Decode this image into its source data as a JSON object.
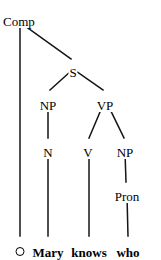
{
  "diagram": {
    "type": "syntax-tree",
    "sentence": "Mary knows who",
    "stroke_color": "#141414",
    "background_color": "#ffffff",
    "nodes": [
      {
        "id": "comp",
        "label": "Comp",
        "x": 20,
        "y": 15,
        "anchor": "left",
        "label_x": 2
      },
      {
        "id": "s",
        "label": "S",
        "x": 73,
        "y": 66
      },
      {
        "id": "np1",
        "label": "NP",
        "x": 48,
        "y": 99
      },
      {
        "id": "vp",
        "label": "VP",
        "x": 105,
        "y": 99
      },
      {
        "id": "n",
        "label": "N",
        "x": 48,
        "y": 146
      },
      {
        "id": "v",
        "label": "V",
        "x": 88,
        "y": 146
      },
      {
        "id": "np2",
        "label": "NP",
        "x": 125,
        "y": 146
      },
      {
        "id": "pron",
        "label": "Pron",
        "x": 127,
        "y": 190
      }
    ],
    "terminals": [
      {
        "id": "empty",
        "label": "O",
        "icon": "empty-circle-node",
        "x": 20,
        "y": 246
      },
      {
        "id": "mary",
        "label": "Mary",
        "x": 48,
        "y": 246
      },
      {
        "id": "knows",
        "label": "knows",
        "x": 89,
        "y": 246
      },
      {
        "id": "who",
        "label": "who",
        "x": 128,
        "y": 246
      }
    ],
    "edges": [
      {
        "id": "comp-empty",
        "from": "Comp",
        "to": "O",
        "x1": 20,
        "y1": 24,
        "x2": 20,
        "y2": 236
      },
      {
        "id": "comp-s",
        "from": "Comp",
        "to": "S",
        "x1": 21,
        "y1": 23,
        "x2": 71,
        "y2": 59
      },
      {
        "id": "s-np1",
        "from": "S",
        "to": "NP",
        "x1": 71,
        "y1": 71,
        "x2": 50,
        "y2": 90
      },
      {
        "id": "s-vp",
        "from": "S",
        "to": "VP",
        "x1": 76,
        "y1": 71,
        "x2": 103,
        "y2": 90
      },
      {
        "id": "np1-n",
        "from": "NP",
        "to": "N",
        "x1": 48,
        "y1": 105,
        "x2": 48,
        "y2": 138
      },
      {
        "id": "vp-v",
        "from": "VP",
        "to": "V",
        "x1": 103,
        "y1": 105,
        "x2": 89,
        "y2": 138
      },
      {
        "id": "vp-np2",
        "from": "VP",
        "to": "NP",
        "x1": 108,
        "y1": 105,
        "x2": 124,
        "y2": 138
      },
      {
        "id": "n-mary",
        "from": "N",
        "to": "Mary",
        "x1": 48,
        "y1": 152,
        "x2": 48,
        "y2": 236
      },
      {
        "id": "v-knows",
        "from": "V",
        "to": "knows",
        "x1": 89,
        "y1": 152,
        "x2": 89,
        "y2": 236
      },
      {
        "id": "np2-pron",
        "from": "NP",
        "to": "Pron",
        "x1": 125,
        "y1": 152,
        "x2": 126,
        "y2": 182
      },
      {
        "id": "pron-who",
        "from": "Pron",
        "to": "who",
        "x1": 127,
        "y1": 196,
        "x2": 128,
        "y2": 236
      }
    ]
  }
}
